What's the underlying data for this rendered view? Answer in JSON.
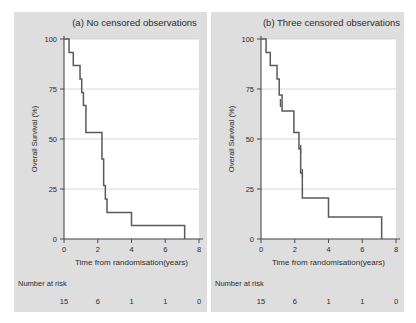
{
  "figure": {
    "width": 416,
    "height": 323,
    "panel_background_color": "#dedede",
    "plot_background_color": "#ffffff",
    "curve_color": "#5a5a5a",
    "grid_color": "#c9c9c9",
    "axis_color": "#4a4a4a"
  },
  "chart_data": [
    {
      "type": "line",
      "subtype": "kaplan-meier-step",
      "panel": "a",
      "title": "(a) No censored observations",
      "xlabel": "Time from randomisation(years)",
      "ylabel": "Overall Survival (%)",
      "xlim": [
        0,
        8
      ],
      "ylim": [
        0,
        100
      ],
      "xticks": [
        0,
        2,
        4,
        6,
        8
      ],
      "xtick_labels": [
        "0",
        "2",
        "4",
        "6",
        "8"
      ],
      "yticks": [
        0,
        25,
        50,
        75,
        100
      ],
      "ytick_labels": [
        "0",
        "25",
        "50",
        "75",
        "100"
      ],
      "grid": true,
      "legend": "none",
      "n_at_risk_label": "Number at risk",
      "n_at_risk_times": [
        0,
        2,
        4,
        6,
        8
      ],
      "n_at_risk_values": [
        "15",
        "6",
        "1",
        "1",
        "0"
      ],
      "censored_times": [],
      "step_points": [
        {
          "t": 0.0,
          "s": 100
        },
        {
          "t": 0.3,
          "s": 100
        },
        {
          "t": 0.3,
          "s": 93.3
        },
        {
          "t": 0.55,
          "s": 93.3
        },
        {
          "t": 0.55,
          "s": 86.7
        },
        {
          "t": 0.95,
          "s": 86.7
        },
        {
          "t": 0.95,
          "s": 80.0
        },
        {
          "t": 1.05,
          "s": 80.0
        },
        {
          "t": 1.05,
          "s": 73.3
        },
        {
          "t": 1.15,
          "s": 73.3
        },
        {
          "t": 1.15,
          "s": 66.7
        },
        {
          "t": 1.3,
          "s": 66.7
        },
        {
          "t": 1.3,
          "s": 53.3
        },
        {
          "t": 2.25,
          "s": 53.3
        },
        {
          "t": 2.25,
          "s": 40.0
        },
        {
          "t": 2.35,
          "s": 40.0
        },
        {
          "t": 2.35,
          "s": 26.7
        },
        {
          "t": 2.45,
          "s": 26.7
        },
        {
          "t": 2.45,
          "s": 20.0
        },
        {
          "t": 2.55,
          "s": 20.0
        },
        {
          "t": 2.55,
          "s": 13.3
        },
        {
          "t": 4.0,
          "s": 13.3
        },
        {
          "t": 4.0,
          "s": 6.7
        },
        {
          "t": 7.15,
          "s": 6.7
        },
        {
          "t": 7.15,
          "s": 0.0
        }
      ]
    },
    {
      "type": "line",
      "subtype": "kaplan-meier-step",
      "panel": "b",
      "title": "(b) Three censored observations",
      "xlabel": "Time from randomisation(years)",
      "ylabel": "Overall Survival (%)",
      "xlim": [
        0,
        8
      ],
      "ylim": [
        0,
        100
      ],
      "xticks": [
        0,
        2,
        4,
        6,
        8
      ],
      "xtick_labels": [
        "0",
        "2",
        "4",
        "6",
        "8"
      ],
      "yticks": [
        0,
        25,
        50,
        75,
        100
      ],
      "ytick_labels": [
        "0",
        "25",
        "50",
        "75",
        "100"
      ],
      "grid": true,
      "legend": "none",
      "n_at_risk_label": "Number at risk",
      "n_at_risk_times": [
        0,
        2,
        4,
        6,
        8
      ],
      "n_at_risk_values": [
        "15",
        "6",
        "1",
        "1",
        "0"
      ],
      "censored_times": [
        1.15,
        2.35,
        2.45
      ],
      "censored_survivals": [
        68.0,
        45.0,
        33.0
      ],
      "step_points": [
        {
          "t": 0.0,
          "s": 100
        },
        {
          "t": 0.3,
          "s": 100
        },
        {
          "t": 0.3,
          "s": 93.3
        },
        {
          "t": 0.55,
          "s": 93.3
        },
        {
          "t": 0.55,
          "s": 86.7
        },
        {
          "t": 0.95,
          "s": 86.7
        },
        {
          "t": 0.95,
          "s": 80.0
        },
        {
          "t": 1.08,
          "s": 80.0
        },
        {
          "t": 1.08,
          "s": 72.0
        },
        {
          "t": 1.25,
          "s": 72.0
        },
        {
          "t": 1.25,
          "s": 64.0
        },
        {
          "t": 1.95,
          "s": 64.0
        },
        {
          "t": 1.95,
          "s": 53.3
        },
        {
          "t": 2.25,
          "s": 53.3
        },
        {
          "t": 2.25,
          "s": 45.0
        },
        {
          "t": 2.35,
          "s": 45.0
        },
        {
          "t": 2.35,
          "s": 33.0
        },
        {
          "t": 2.45,
          "s": 33.0
        },
        {
          "t": 2.45,
          "s": 20.5
        },
        {
          "t": 4.0,
          "s": 20.5
        },
        {
          "t": 4.0,
          "s": 11.0
        },
        {
          "t": 7.15,
          "s": 11.0
        },
        {
          "t": 7.15,
          "s": 0.0
        }
      ]
    }
  ]
}
